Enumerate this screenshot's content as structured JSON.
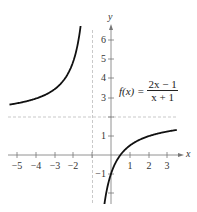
{
  "chart_data": {
    "type": "line",
    "title": "",
    "function_label": {
      "lhs": "f(x) =",
      "numerator": "2x − 1",
      "denominator": "x + 1"
    },
    "xlabel": "x",
    "ylabel": "y",
    "x_ticks": [
      -5,
      -4,
      -3,
      -2,
      1,
      2,
      3
    ],
    "x_tick_labels": [
      "−5",
      "−4",
      "−3",
      "−2",
      "1",
      "2",
      "3"
    ],
    "y_ticks": [
      -1,
      1,
      3,
      4,
      5,
      6
    ],
    "y_tick_labels": [
      "−1",
      "1",
      "3",
      "4",
      "5",
      "6"
    ],
    "xlim": [
      -5.5,
      3.8
    ],
    "ylim": [
      -2.6,
      7.3
    ],
    "asymptotes": {
      "vertical": -1,
      "horizontal": 2
    },
    "series": [
      {
        "name": "f(x) = (2x-1)/(x+1), left branch",
        "x": [
          -5.4,
          -5,
          -4,
          -3,
          -2.5,
          -2,
          -1.8,
          -1.6,
          -1.53
        ],
        "y": [
          2.7,
          2.75,
          3.0,
          3.5,
          4.0,
          5.0,
          5.75,
          7.0,
          7.66
        ]
      },
      {
        "name": "f(x) = (2x-1)/(x+1), right branch",
        "x": [
          -0.6,
          -0.5,
          -0.25,
          0,
          0.5,
          1,
          2,
          3,
          3.5
        ],
        "y": [
          -5.5,
          -4.0,
          -2.0,
          -1.0,
          0.0,
          0.5,
          1.0,
          1.25,
          1.33
        ]
      }
    ],
    "grid": false,
    "legend": null
  },
  "labels": {
    "x_axis": "x",
    "y_axis": "y",
    "f_lhs": "f(x) =",
    "f_num": "2x − 1",
    "f_den": "x + 1",
    "xt": [
      "−5",
      "−4",
      "−3",
      "−2",
      "1",
      "2",
      "3"
    ],
    "yt": [
      "6",
      "5",
      "4",
      "3",
      "1",
      "−1"
    ]
  }
}
